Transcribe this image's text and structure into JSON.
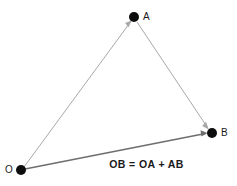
{
  "diagram": {
    "type": "vector-addition-triangle",
    "background_color": "#ffffff",
    "points": [
      {
        "id": "A",
        "label": "A",
        "x": 134,
        "y": 17,
        "dot_radius": 5.0,
        "dot_color": "#0d0d0d",
        "label_x": 147,
        "label_y": 17
      },
      {
        "id": "B",
        "label": "B",
        "x": 212,
        "y": 133,
        "dot_radius": 5.0,
        "dot_color": "#0d0d0d",
        "label_x": 224,
        "label_y": 133
      },
      {
        "id": "O",
        "label": "O",
        "x": 21,
        "y": 170,
        "dot_radius": 5.0,
        "dot_color": "#0d0d0d",
        "label_x": 9,
        "label_y": 170
      }
    ],
    "vectors": [
      {
        "id": "OA",
        "name": "vector-oa",
        "from": "O",
        "to": "A",
        "color": "#a8a8a8",
        "width": 1.0,
        "arrowhead": true
      },
      {
        "id": "AB",
        "name": "vector-ab",
        "from": "A",
        "to": "B",
        "color": "#a8a8a8",
        "width": 1.0,
        "arrowhead": true
      },
      {
        "id": "OB",
        "name": "vector-ob",
        "from": "O",
        "to": "B",
        "color": "#6e6e6e",
        "width": 1.6,
        "arrowhead": true
      }
    ],
    "equation": "OB = OA + AB",
    "equation_x": 146,
    "equation_y": 166,
    "label_color": "#1a1a1a"
  }
}
